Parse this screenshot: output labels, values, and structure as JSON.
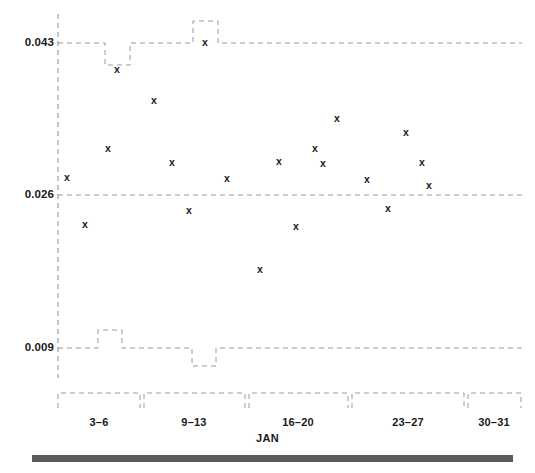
{
  "figure": {
    "width": 535,
    "height": 473,
    "background": "#ffffff",
    "marker_glyph": "x",
    "marker_color": "#1a1a1a",
    "gridline_color": "#9a9a9a",
    "axis_color": "#8a8a8a",
    "bottom_bar_color": "#5a5a5a"
  },
  "chart_data": {
    "type": "scatter",
    "title": "",
    "xlabel": "JAN",
    "ylabel": "",
    "grid": true,
    "legend": "none",
    "ylim": [
      0.009,
      0.043
    ],
    "yticks": [
      0.009,
      0.026,
      0.043
    ],
    "ytick_labels": [
      "0.009",
      "0.026",
      "0.043"
    ],
    "xlim": [
      1,
      31
    ],
    "xtick_groups": [
      {
        "label": "3-6",
        "start": 3,
        "end": 6
      },
      {
        "label": "9-13",
        "start": 9,
        "end": 13
      },
      {
        "label": "16-20",
        "start": 16,
        "end": 20
      },
      {
        "label": "23-27",
        "start": 23,
        "end": 27
      },
      {
        "label": "30-31",
        "start": 30,
        "end": 31
      }
    ],
    "x": [
      2,
      3,
      4,
      5,
      7,
      8,
      9,
      10,
      11,
      13,
      14,
      15,
      16,
      17,
      18,
      20,
      21,
      22,
      23,
      24
    ],
    "y": [
      0.028,
      0.0228,
      0.0312,
      0.04,
      0.0366,
      0.0297,
      0.0243,
      0.043,
      0.0279,
      0.0179,
      0.0298,
      0.0226,
      0.0312,
      0.0295,
      0.0346,
      0.0278,
      0.0246,
      0.0331,
      0.0297,
      0.0271
    ],
    "points": [
      {
        "px": 67,
        "py": 177,
        "value": 0.028
      },
      {
        "px": 85,
        "py": 224,
        "value": 0.0228
      },
      {
        "px": 108,
        "py": 148,
        "value": 0.0312
      },
      {
        "px": 117,
        "py": 69,
        "value": 0.04
      },
      {
        "px": 154,
        "py": 100,
        "value": 0.0366
      },
      {
        "px": 172,
        "py": 162,
        "value": 0.0297
      },
      {
        "px": 189,
        "py": 210,
        "value": 0.0243
      },
      {
        "px": 205,
        "py": 42,
        "value": 0.043
      },
      {
        "px": 227,
        "py": 178,
        "value": 0.0279
      },
      {
        "px": 260,
        "py": 269,
        "value": 0.0179
      },
      {
        "px": 279,
        "py": 161,
        "value": 0.0298
      },
      {
        "px": 296,
        "py": 226,
        "value": 0.0226
      },
      {
        "px": 315,
        "py": 148,
        "value": 0.0312
      },
      {
        "px": 323,
        "py": 163,
        "value": 0.0295
      },
      {
        "px": 337,
        "py": 118,
        "value": 0.0346
      },
      {
        "px": 367,
        "py": 179,
        "value": 0.0278
      },
      {
        "px": 388,
        "py": 208,
        "value": 0.0246
      },
      {
        "px": 406,
        "py": 132,
        "value": 0.0331
      },
      {
        "px": 422,
        "py": 162,
        "value": 0.0297
      },
      {
        "px": 429,
        "py": 185,
        "value": 0.0271
      }
    ]
  },
  "axes": {
    "y_axis_px": 58,
    "y_axis_top_px": 14,
    "y_axis_bottom_px": 378,
    "plot_right_px": 522,
    "yticks_px": [
      {
        "label": "0.043",
        "py": 43,
        "value": 0.043
      },
      {
        "label": "0.026",
        "py": 195,
        "value": 0.026
      },
      {
        "label": "0.009",
        "py": 348,
        "value": 0.009
      }
    ],
    "gridline_detours": [
      {
        "gridline": 0.043,
        "from_px": 105,
        "to_px": 130,
        "direction": "down",
        "amount": 22
      },
      {
        "gridline": 0.043,
        "from_px": 193,
        "to_px": 218,
        "direction": "up",
        "amount": 22
      },
      {
        "gridline": 0.009,
        "from_px": 98,
        "to_px": 122,
        "direction": "up",
        "amount": 18
      },
      {
        "gridline": 0.009,
        "from_px": 192,
        "to_px": 216,
        "direction": "down",
        "amount": 18
      }
    ],
    "xgroup_brackets_px": [
      {
        "label": "3-6",
        "left": 58,
        "right": 140,
        "center": 99
      },
      {
        "label": "9-13",
        "left": 144,
        "right": 245,
        "center": 194
      },
      {
        "label": "16-20",
        "left": 249,
        "right": 348,
        "center": 298
      },
      {
        "label": "23-27",
        "left": 352,
        "right": 464,
        "center": 408
      },
      {
        "label": "30-31",
        "left": 468,
        "right": 521,
        "center": 494
      }
    ],
    "xgroup_bracket_top_px": 393,
    "xgroup_bracket_depth_px": 15,
    "xgroup_label_y_px": 417
  }
}
